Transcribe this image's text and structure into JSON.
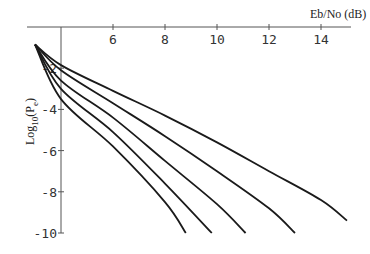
{
  "chart_data": {
    "type": "line",
    "title": "",
    "xlabel": "Eb/No (dB)",
    "ylabel": "Log10(Pe)",
    "xlim": [
      3,
      15.2
    ],
    "ylim": [
      -10,
      0
    ],
    "x_axis_crosses_y_at": 0,
    "y_axis_crosses_x_at": 4,
    "x_ticks": [
      6,
      8,
      10,
      12,
      14
    ],
    "y_ticks": [
      -2,
      -4,
      -6,
      -8,
      -10
    ],
    "grid": false,
    "legend": null,
    "series": [
      {
        "name": "curve-1",
        "points": [
          [
            3,
            -0.85
          ],
          [
            4,
            -1.85
          ],
          [
            6,
            -3.1
          ],
          [
            8,
            -4.3
          ],
          [
            10,
            -5.6
          ],
          [
            12,
            -7.0
          ],
          [
            14,
            -8.4
          ],
          [
            15,
            -9.4
          ]
        ]
      },
      {
        "name": "curve-2",
        "points": [
          [
            3,
            -0.85
          ],
          [
            4,
            -2.1
          ],
          [
            6,
            -3.7
          ],
          [
            8,
            -5.3
          ],
          [
            10,
            -7.0
          ],
          [
            12,
            -8.8
          ],
          [
            13,
            -10
          ]
        ]
      },
      {
        "name": "curve-3",
        "points": [
          [
            3,
            -0.85
          ],
          [
            4,
            -2.6
          ],
          [
            6,
            -4.4
          ],
          [
            8,
            -6.5
          ],
          [
            10,
            -8.6
          ],
          [
            11.1,
            -10
          ]
        ]
      },
      {
        "name": "curve-4",
        "points": [
          [
            3,
            -0.85
          ],
          [
            4,
            -3.0
          ],
          [
            6,
            -5.1
          ],
          [
            8,
            -7.6
          ],
          [
            9.8,
            -10
          ]
        ]
      },
      {
        "name": "curve-5",
        "points": [
          [
            3,
            -0.85
          ],
          [
            4,
            -3.5
          ],
          [
            6,
            -5.8
          ],
          [
            8,
            -8.5
          ],
          [
            8.8,
            -10
          ]
        ]
      }
    ]
  },
  "labels": {
    "x_title": "Eb/No (dB)",
    "y_title_main": "Log",
    "y_title_sub": "10",
    "y_title_tail": "(P",
    "y_title_sub2": "e",
    "y_title_close": ")"
  },
  "colors": {
    "line": "#1a1a1a",
    "axis": "#555555"
  }
}
